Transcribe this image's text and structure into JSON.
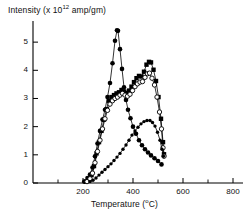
{
  "chart_data": {
    "type": "line",
    "title": "",
    "xlabel": "Temperature  (°C)",
    "ylabel": "Intensity  (x 10¹² amp/gm)",
    "ylabel_parts": {
      "main": "Intensity  (x 10",
      "exponent": "12",
      "tail": " amp/gm)"
    },
    "xlabel_parts": {
      "main": "Temperature  (",
      "sup": "o",
      "tail": "C)"
    },
    "xlim": [
      0,
      840
    ],
    "ylim": [
      0,
      5.75
    ],
    "xticks": [
      200,
      400,
      600,
      800
    ],
    "xticklabels": [
      "200",
      "400",
      "600",
      "800"
    ],
    "xminorticks": [
      100,
      300,
      500,
      700
    ],
    "yticks": [
      0,
      1,
      2,
      3,
      4,
      5
    ],
    "yticklabels": [
      "0",
      "1",
      "2",
      "3",
      "4",
      "5"
    ],
    "grid": false,
    "legend": "none",
    "series": [
      {
        "name": "filled-circle-series",
        "marker": "filled-circle",
        "points": [
          [
            205,
            0.05
          ],
          [
            218,
            0.18
          ],
          [
            228,
            0.3
          ],
          [
            238,
            0.55
          ],
          [
            248,
            0.95
          ],
          [
            258,
            1.4
          ],
          [
            268,
            1.85
          ],
          [
            278,
            2.25
          ],
          [
            288,
            2.6
          ],
          [
            298,
            3.05
          ],
          [
            308,
            3.55
          ],
          [
            318,
            4.25
          ],
          [
            328,
            5.05
          ],
          [
            336,
            5.42
          ],
          [
            340,
            5.4
          ],
          [
            348,
            4.75
          ],
          [
            356,
            4.05
          ],
          [
            364,
            3.4
          ],
          [
            372,
            2.95
          ],
          [
            380,
            2.6
          ],
          [
            390,
            2.3
          ],
          [
            400,
            2.0
          ],
          [
            412,
            1.75
          ],
          [
            424,
            1.52
          ],
          [
            436,
            1.34
          ],
          [
            448,
            1.2
          ],
          [
            460,
            1.08
          ],
          [
            472,
            0.98
          ],
          [
            486,
            0.88
          ],
          [
            500,
            0.78
          ],
          [
            514,
            0.66
          ]
        ]
      },
      {
        "name": "filled-square-series",
        "marker": "filled-square",
        "points": [
          [
            212,
            0.05
          ],
          [
            224,
            0.12
          ],
          [
            234,
            0.28
          ],
          [
            244,
            0.6
          ],
          [
            254,
            1.05
          ],
          [
            264,
            1.45
          ],
          [
            274,
            1.85
          ],
          [
            284,
            2.25
          ],
          [
            294,
            2.62
          ],
          [
            304,
            2.92
          ],
          [
            314,
            3.05
          ],
          [
            324,
            3.12
          ],
          [
            334,
            3.18
          ],
          [
            344,
            3.22
          ],
          [
            354,
            3.3
          ],
          [
            364,
            3.25
          ],
          [
            374,
            3.2
          ],
          [
            384,
            3.28
          ],
          [
            394,
            3.42
          ],
          [
            404,
            3.58
          ],
          [
            414,
            3.72
          ],
          [
            424,
            3.8
          ],
          [
            434,
            3.78
          ],
          [
            444,
            3.95
          ],
          [
            454,
            4.2
          ],
          [
            464,
            4.3
          ],
          [
            472,
            4.28
          ],
          [
            482,
            4.02
          ],
          [
            492,
            3.62
          ],
          [
            502,
            3.05
          ],
          [
            512,
            2.28
          ],
          [
            520,
            1.45
          ],
          [
            524,
            1.02
          ]
        ]
      },
      {
        "name": "open-circle-series",
        "marker": "open-circle",
        "points": [
          [
            216,
            0.05
          ],
          [
            228,
            0.15
          ],
          [
            238,
            0.35
          ],
          [
            248,
            0.72
          ],
          [
            258,
            1.12
          ],
          [
            268,
            1.52
          ],
          [
            278,
            1.92
          ],
          [
            288,
            2.28
          ],
          [
            298,
            2.58
          ],
          [
            308,
            2.8
          ],
          [
            318,
            2.92
          ],
          [
            328,
            3.0
          ],
          [
            338,
            3.05
          ],
          [
            348,
            3.12
          ],
          [
            358,
            3.18
          ],
          [
            368,
            3.12
          ],
          [
            378,
            3.08
          ],
          [
            388,
            3.15
          ],
          [
            398,
            3.28
          ],
          [
            408,
            3.42
          ],
          [
            418,
            3.52
          ],
          [
            428,
            3.58
          ],
          [
            438,
            3.6
          ],
          [
            448,
            3.75
          ],
          [
            458,
            3.88
          ],
          [
            466,
            3.9
          ],
          [
            476,
            3.72
          ],
          [
            486,
            3.48
          ],
          [
            496,
            3.05
          ],
          [
            506,
            2.52
          ],
          [
            514,
            1.92
          ],
          [
            520,
            1.25
          ],
          [
            524,
            0.95
          ]
        ]
      },
      {
        "name": "small-filled-circle-series",
        "marker": "small-filled-circle",
        "points": [
          [
            228,
            0.05
          ],
          [
            240,
            0.1
          ],
          [
            252,
            0.18
          ],
          [
            264,
            0.28
          ],
          [
            276,
            0.38
          ],
          [
            288,
            0.48
          ],
          [
            300,
            0.58
          ],
          [
            312,
            0.68
          ],
          [
            324,
            0.8
          ],
          [
            336,
            0.92
          ],
          [
            348,
            1.05
          ],
          [
            360,
            1.2
          ],
          [
            372,
            1.35
          ],
          [
            384,
            1.52
          ],
          [
            396,
            1.7
          ],
          [
            408,
            1.85
          ],
          [
            420,
            1.98
          ],
          [
            432,
            2.1
          ],
          [
            444,
            2.18
          ],
          [
            456,
            2.22
          ],
          [
            468,
            2.22
          ],
          [
            478,
            2.15
          ],
          [
            488,
            2.02
          ],
          [
            498,
            1.8
          ],
          [
            508,
            1.52
          ],
          [
            516,
            1.2
          ],
          [
            522,
            0.95
          ]
        ]
      }
    ]
  }
}
